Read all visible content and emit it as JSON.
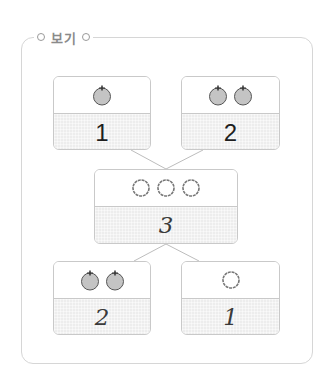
{
  "header": {
    "title": "보기"
  },
  "diagram": {
    "top_left": {
      "icon": "apple-icon",
      "icon_count": 1,
      "value": "1"
    },
    "top_right": {
      "icon": "apple-icon",
      "icon_count": 2,
      "value": "2"
    },
    "middle": {
      "icon": "circle-icon",
      "icon_count": 3,
      "value": "3"
    },
    "bottom_left": {
      "icon": "apple-icon",
      "icon_count": 2,
      "value": "2"
    },
    "bottom_right": {
      "icon": "circle-icon",
      "icon_count": 1,
      "value": "1"
    }
  },
  "colors": {
    "frame": "#d6d6d6",
    "box_border": "#c9c9c9",
    "shaded": "#ededed",
    "apple_fill": "#c4c4c4",
    "text": "#1e1e1e"
  }
}
